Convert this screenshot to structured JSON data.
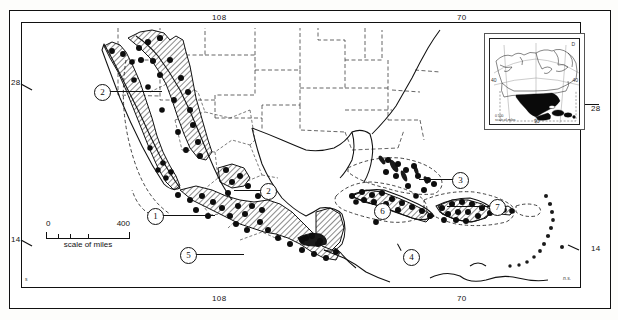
{
  "figure": {
    "type": "distribution-map",
    "region": "Mexico, Central America and the West Indies",
    "bottom_right_credit": "n.s."
  },
  "frame": {
    "corner_mark_bottom_left": "s",
    "longitude_labels": [
      {
        "value": "108",
        "position": "top"
      },
      {
        "value": "70",
        "position": "top"
      },
      {
        "value": "108",
        "position": "bottom"
      },
      {
        "value": "70",
        "position": "bottom"
      }
    ],
    "latitude_labels": [
      {
        "value": "28",
        "position": "left"
      },
      {
        "value": "14",
        "position": "left"
      },
      {
        "value": "28",
        "position": "right"
      },
      {
        "value": "14",
        "position": "right"
      }
    ]
  },
  "scale": {
    "min_label": "0",
    "max_label": "400",
    "caption": "scale of miles",
    "units": "miles",
    "tick_count": 4
  },
  "callouts": [
    {
      "id": "1",
      "label": "1",
      "x": 147,
      "y": 208,
      "leader_to_x": 214,
      "region": "western Mexico / Sierra Madre Occidental"
    },
    {
      "id": "2",
      "label": "2",
      "x": 94,
      "y": 84,
      "leader_to_x": 160,
      "region": "Baja California / northwestern Mexico"
    },
    {
      "id": "2b",
      "label": "2",
      "x": 260,
      "y": 183,
      "leader_to_x": 232,
      "region": "eastern Mexico / Sierra Madre Oriental"
    },
    {
      "id": "3",
      "label": "3",
      "x": 452,
      "y": 172,
      "leader_to_x": 418,
      "region": "Bahamas"
    },
    {
      "id": "4",
      "label": "4",
      "x": 403,
      "y": 249,
      "leader_to_x": 392,
      "region": "Jamaica"
    },
    {
      "id": "5",
      "label": "5",
      "x": 180,
      "y": 247,
      "leader_to_x": 243,
      "region": "southern Mexico / Oaxaca"
    },
    {
      "id": "6",
      "label": "6",
      "x": 381,
      "y": 209,
      "leader_to_x": 381,
      "region": "Cuba"
    },
    {
      "id": "7",
      "label": "7",
      "x": 489,
      "y": 199,
      "leader_to_x": 446,
      "region": "Hispaniola / Puerto Rico"
    }
  ],
  "inset": {
    "title_corner": "D",
    "left_label": "40",
    "right_label": "40",
    "bottom_label": "90",
    "caption_line1": "scale of miles",
    "caption_line2": "0        500",
    "description": "North America locator, study area shaded solid black"
  },
  "legend_semantics": {
    "hatched_fill": "shaded range area",
    "black_dots": "collection localities",
    "dashed_outline": "range boundary"
  },
  "colors": {
    "ink": "#111111",
    "paper": "#ffffff",
    "hatch": "#2b2b2b",
    "page": "#fdfdfb"
  }
}
